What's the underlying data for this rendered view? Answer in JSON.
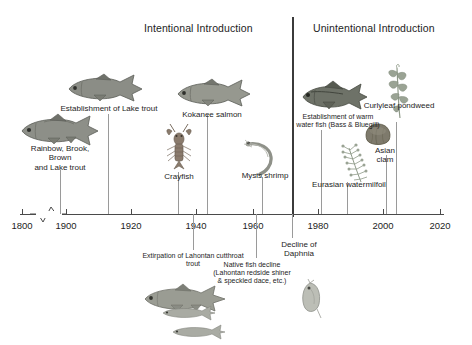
{
  "figure": {
    "sections": [
      {
        "id": "intentional",
        "label": "Intentional Introduction"
      },
      {
        "id": "unintentional",
        "label": "Unintentional Introduction"
      }
    ],
    "divider_year": 1975
  },
  "axis": {
    "ticks": [
      "1800",
      "1900",
      "1920",
      "1940",
      "1960",
      "1980",
      "2000",
      "2020"
    ],
    "minor_ticks": [
      "1910",
      "1930",
      "1950",
      "1970",
      "1990",
      "2010"
    ],
    "has_break": true,
    "break_between": [
      "1800",
      "1900"
    ]
  },
  "events": {
    "above": [
      {
        "id": "rainbow-brook-brown-lake-trout",
        "label": "Rainbow, Brook,\nBrown\nand Lake trout",
        "year": 1890,
        "organism": "trout"
      },
      {
        "id": "establishment-lake-trout",
        "label": "Establishment of Lake trout",
        "year": 1915,
        "organism": "lake-trout"
      },
      {
        "id": "kokanee-salmon",
        "label": "Kokanee salmon",
        "year": 1944,
        "organism": "salmon"
      },
      {
        "id": "crayfish",
        "label": "Crayfish",
        "year": 1935,
        "organism": "crayfish"
      },
      {
        "id": "mysis-shrimp",
        "label": "Mysis shrimp",
        "year": 1963,
        "organism": "shrimp"
      },
      {
        "id": "establishment-warm-water-fish",
        "label": "Establishment of warm\nwater fish (Bass & Bluegill)",
        "year": 1982,
        "organism": "bass"
      },
      {
        "id": "curlyleaf-pondweed",
        "label": "Curlyleaf pondweed",
        "year": 2003,
        "organism": "pondweed"
      },
      {
        "id": "asian-clam",
        "label": "Asian\nclam",
        "year": 2008,
        "organism": "clam"
      },
      {
        "id": "eurasian-watermilfoil",
        "label": "Eurasian watermilfoil",
        "year": 1995,
        "organism": "milfoil"
      }
    ],
    "below": [
      {
        "id": "extirpation-lahontan-cutthroat-trout",
        "label": "Extirpation of Lahontan cutthroat\ntrout",
        "year": 1939,
        "organism": "cutthroat-trout"
      },
      {
        "id": "native-fish-decline",
        "label": "Native fish decline\n(Lahontan redside shiner\n& speckled dace, etc.)",
        "year": 1962,
        "organism": "small-fish"
      },
      {
        "id": "decline-of-daphnia",
        "label": "Decline of\nDaphnia",
        "year": 1974,
        "organism": "daphnia"
      }
    ]
  },
  "colors": {
    "axis": "#4a4a4a",
    "divider": "#3b3b3b",
    "leader": "#9a9a9a",
    "text": "#1d1d1d",
    "fish_body": "#8d8f88",
    "fish_dark": "#5b5d57",
    "plant": "#9aa394",
    "crayfish": "#8a7b6d"
  }
}
